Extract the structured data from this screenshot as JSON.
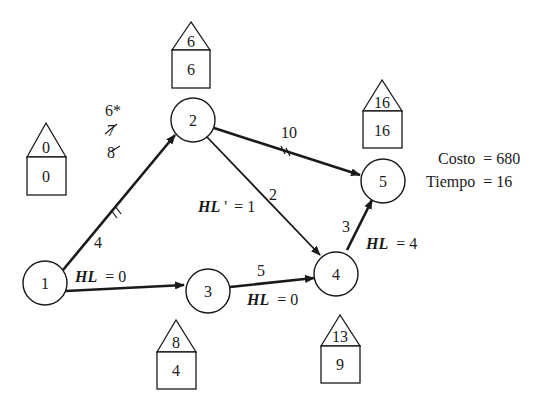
{
  "nodes": [
    {
      "id": "1",
      "label": "1"
    },
    {
      "id": "2",
      "label": "2"
    },
    {
      "id": "3",
      "label": "3"
    },
    {
      "id": "4",
      "label": "4"
    },
    {
      "id": "5",
      "label": "5"
    }
  ],
  "houses": {
    "n1": {
      "top": "0",
      "bottom": "0"
    },
    "n2": {
      "top": "6",
      "bottom": "6"
    },
    "n3": {
      "top": "8",
      "bottom": "4"
    },
    "n4": {
      "top": "13",
      "bottom": "9"
    },
    "n5": {
      "top": "16",
      "bottom": "16"
    }
  },
  "edges": {
    "e12": {
      "durations": [
        "6*",
        "7",
        "8"
      ],
      "struck": [
        "7",
        "8"
      ],
      "crashed_marker": "double-tick"
    },
    "e13": {
      "duration": "4",
      "hl_label": "HL",
      "hl_value": "= 0"
    },
    "e25": {
      "duration": "10",
      "crashed_marker": "double-tick"
    },
    "e24": {
      "duration": "2",
      "hl_label": "HL",
      "hl_prime": "'",
      "hl_value": "= 1"
    },
    "e34": {
      "duration": "5",
      "hl_label": "HL",
      "hl_value": "= 0"
    },
    "e45": {
      "duration": "3",
      "hl_label": "HL",
      "hl_value": "= 4"
    }
  },
  "summary": {
    "cost_label": "Costo",
    "cost_value": "= 680",
    "time_label": "Tiempo",
    "time_value": "= 16"
  }
}
